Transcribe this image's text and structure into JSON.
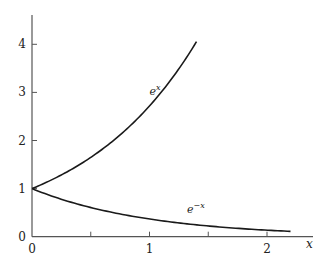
{
  "chart_data": {
    "type": "line",
    "title": "",
    "xlabel": "x",
    "ylabel": "",
    "xlim": [
      0,
      2.4
    ],
    "ylim": [
      0,
      4.5
    ],
    "grid": false,
    "legend": "none (inline curve labels)",
    "x_ticks": [
      0,
      0.5,
      1,
      1.5,
      2
    ],
    "x_tick_labels": [
      "0",
      "",
      "1",
      "",
      "2"
    ],
    "y_ticks": [
      0,
      1,
      2,
      3,
      4
    ],
    "y_tick_labels": [
      "0",
      "1",
      "2",
      "3",
      "4"
    ],
    "series": [
      {
        "name": "e^x",
        "label_base": "e",
        "label_exp": "x",
        "function": "exp(x)",
        "x_range": [
          0,
          1.4
        ],
        "x": [
          0,
          0.2,
          0.4,
          0.6,
          0.8,
          1.0,
          1.2,
          1.4
        ],
        "values": [
          1.0,
          1.22,
          1.49,
          1.82,
          2.23,
          2.72,
          3.32,
          4.06
        ],
        "color": "#1a1a1a",
        "label_position": [
          1.0,
          2.95
        ]
      },
      {
        "name": "e^-x",
        "label_base": "e",
        "label_exp": "−x",
        "function": "exp(-x)",
        "x_range": [
          0,
          2.2
        ],
        "x": [
          0,
          0.2,
          0.4,
          0.6,
          0.8,
          1.0,
          1.2,
          1.4,
          1.6,
          1.8,
          2.0,
          2.2
        ],
        "values": [
          1.0,
          0.82,
          0.67,
          0.55,
          0.45,
          0.37,
          0.3,
          0.25,
          0.2,
          0.17,
          0.14,
          0.11
        ],
        "color": "#1a1a1a",
        "label_position": [
          1.32,
          0.5
        ]
      }
    ]
  },
  "layout": {
    "origin_px": [
      32,
      236.7
    ],
    "x_px_per_unit": 117.5,
    "y_px_per_unit": 48.1,
    "y_axis_top_px": 15,
    "x_axis_right_px": 313
  }
}
